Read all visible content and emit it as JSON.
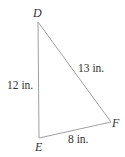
{
  "diagram": {
    "type": "triangle",
    "vertices": [
      {
        "name": "D",
        "x": 38,
        "y": 22
      },
      {
        "name": "E",
        "x": 39,
        "y": 138
      },
      {
        "name": "F",
        "x": 111,
        "y": 122
      }
    ],
    "sides": [
      {
        "from": "D",
        "to": "E",
        "label": "12 in."
      },
      {
        "from": "D",
        "to": "F",
        "label": "13 in."
      },
      {
        "from": "E",
        "to": "F",
        "label": "8 in."
      }
    ],
    "line_color": "#999999",
    "text_color": "#333333"
  }
}
